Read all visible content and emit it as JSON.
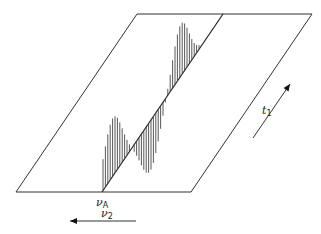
{
  "diagram": {
    "type": "2D NMR spectrum perspective (stacked traces on a plane)",
    "plane": {
      "corners": [
        [
          137,
          14
        ],
        [
          312,
          14
        ],
        [
          191,
          192
        ],
        [
          16,
          192
        ]
      ],
      "stroke": "#333333"
    },
    "diagonal": {
      "from": [
        102,
        192
      ],
      "to": [
        223,
        14
      ]
    },
    "labels": {
      "vA": {
        "main": "ν",
        "sub": "A"
      },
      "v2": {
        "main": "ν",
        "sub": "2"
      },
      "t1": {
        "main": "t",
        "sub": "1"
      }
    },
    "arrows": {
      "v2_arrow": {
        "from": [
          136,
          221
        ],
        "to": [
          70,
          221
        ],
        "direction": "left"
      },
      "t1_arrow": {
        "from": [
          253,
          138
        ],
        "to": [
          290,
          84
        ],
        "direction": "up-right"
      }
    },
    "trace": {
      "description": "Dispersive sinusoid-like signal drawn as vertical hatch lines on the diagonal axis",
      "stroke": "#444444",
      "samples": 34
    }
  }
}
